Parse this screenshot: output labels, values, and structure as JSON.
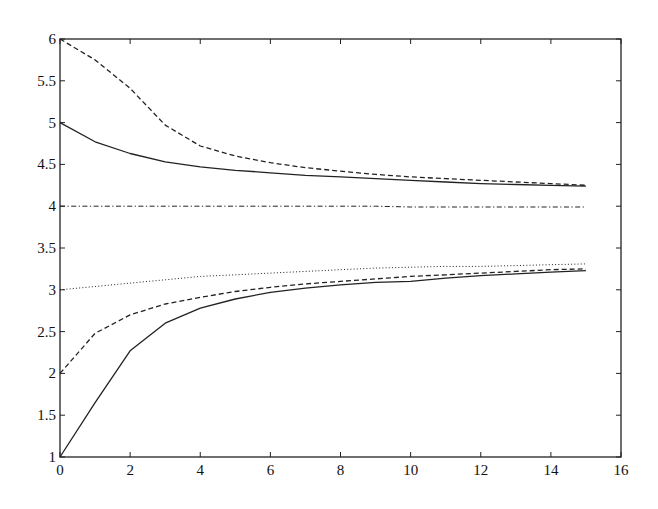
{
  "chart_data": {
    "type": "line",
    "title": "",
    "xlabel": "",
    "ylabel": "",
    "xlim": [
      0,
      16
    ],
    "ylim": [
      1,
      6
    ],
    "grid": false,
    "legend": null,
    "x_ticks": [
      0,
      2,
      4,
      6,
      8,
      10,
      12,
      14,
      16
    ],
    "y_ticks": [
      1,
      1.5,
      2,
      2.5,
      3,
      3.5,
      4,
      4.5,
      5,
      5.5,
      6
    ],
    "x_tick_labels": [
      "0",
      "2",
      "4",
      "6",
      "8",
      "10",
      "12",
      "14",
      "16"
    ],
    "y_tick_labels": [
      "1",
      "1.5",
      "2",
      "2.5",
      "3",
      "3.5",
      "4",
      "4.5",
      "5",
      "5.5",
      "6"
    ],
    "x": [
      0,
      1,
      2,
      3,
      4,
      5,
      6,
      7,
      8,
      9,
      10,
      11,
      12,
      13,
      14,
      15
    ],
    "series": [
      {
        "name": "upper-dashed",
        "style": "dashed",
        "values": [
          6.0,
          5.75,
          5.41,
          4.97,
          4.72,
          4.6,
          4.52,
          4.46,
          4.42,
          4.38,
          4.35,
          4.33,
          4.31,
          4.29,
          4.27,
          4.25
        ]
      },
      {
        "name": "upper-solid",
        "style": "solid",
        "values": [
          5.0,
          4.77,
          4.63,
          4.53,
          4.47,
          4.43,
          4.4,
          4.37,
          4.35,
          4.33,
          4.31,
          4.29,
          4.27,
          4.26,
          4.25,
          4.24
        ]
      },
      {
        "name": "middle-dashdot",
        "style": "dashdot",
        "values": [
          4.0,
          4.0,
          4.0,
          4.0,
          4.0,
          4.0,
          4.0,
          4.0,
          4.0,
          4.0,
          3.99,
          3.99,
          3.99,
          3.99,
          3.99,
          3.99
        ]
      },
      {
        "name": "lower-dotted",
        "style": "dotted",
        "values": [
          3.0,
          3.04,
          3.08,
          3.12,
          3.16,
          3.18,
          3.2,
          3.22,
          3.24,
          3.26,
          3.27,
          3.28,
          3.28,
          3.29,
          3.3,
          3.31
        ]
      },
      {
        "name": "lower-dashed",
        "style": "dashed",
        "values": [
          2.0,
          2.48,
          2.7,
          2.83,
          2.91,
          2.98,
          3.03,
          3.07,
          3.1,
          3.13,
          3.16,
          3.18,
          3.2,
          3.22,
          3.24,
          3.25
        ]
      },
      {
        "name": "lower-solid",
        "style": "solid",
        "values": [
          1.0,
          1.65,
          2.27,
          2.6,
          2.78,
          2.89,
          2.97,
          3.02,
          3.06,
          3.09,
          3.1,
          3.14,
          3.17,
          3.19,
          3.21,
          3.23
        ]
      }
    ]
  },
  "style": {
    "line_color": "#222222",
    "axis_color": "#222222",
    "background": "#ffffff"
  }
}
